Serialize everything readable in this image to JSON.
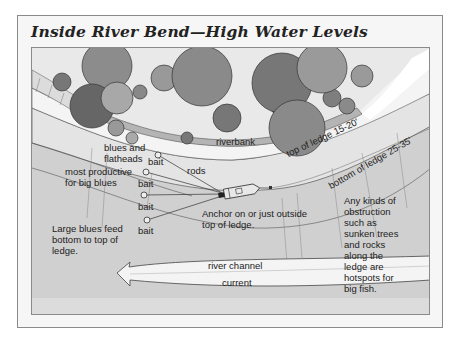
{
  "title": "Inside River Bend—High Water Levels",
  "diagram": {
    "labels": {
      "riverbank": "riverbank",
      "blues_and_flatheads_1": "blues and",
      "blues_and_flatheads_2": "flatheads",
      "most_productive_1": "most productive",
      "most_productive_2": "for big blues",
      "rods": "rods",
      "bait": [
        "bait",
        "bait",
        "bait",
        "bait"
      ],
      "anchor_1": "Anchor on or just outside",
      "anchor_2": "top of ledge.",
      "top_of_ledge": "top of ledge 15-20'",
      "bottom_of_ledge": "bottom of ledge 25-35'",
      "large_blues_1": "Large blues feed",
      "large_blues_2": "bottom to top of",
      "large_blues_3": "ledge.",
      "river_channel": "river channel",
      "current": "current",
      "obstruction": [
        "Any kinds of",
        "obstruction",
        "such as",
        "sunken trees",
        "and rocks",
        "along the",
        "ledge are",
        "hotspots for",
        "big fish."
      ]
    },
    "icons": [
      "tree-icon",
      "boat-icon",
      "bait-marker-icon",
      "current-arrow-icon"
    ],
    "colors": {
      "water_light": "#f2f2f2",
      "water_shallow": "#e6e6e6",
      "channel": "#d2d2d2",
      "bank": "#c8c8c8",
      "tree_dark": "#6e6e6e",
      "tree_mid": "#8c8c8c",
      "line": "#444444"
    }
  }
}
